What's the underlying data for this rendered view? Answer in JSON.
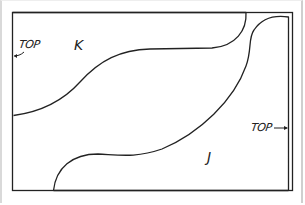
{
  "diagram": {
    "type": "pattern-layout",
    "colors": {
      "line": "#222222",
      "background": "#ffffff",
      "page_edge": "#d0d0d0"
    },
    "pieces": [
      {
        "id": "K",
        "label": "K",
        "grain_marker": {
          "text": "TOP",
          "arrow_direction": "left"
        }
      },
      {
        "id": "J",
        "label": "J",
        "grain_marker": {
          "text": "TOP",
          "arrow_direction": "right"
        }
      }
    ]
  }
}
